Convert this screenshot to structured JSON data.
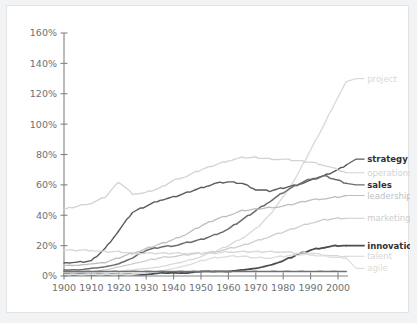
{
  "chart_data": {
    "type": "line",
    "title": "",
    "xlabel": "",
    "ylabel": "",
    "xlim": [
      1900,
      2005
    ],
    "ylim": [
      0,
      160
    ],
    "grid": false,
    "legend_position": "right-inline-labels",
    "x_ticks": [
      "1900",
      "1910",
      "1920",
      "1930",
      "1940",
      "1950",
      "1960",
      "1970",
      "1980",
      "1990",
      "2000"
    ],
    "y_ticks": [
      "0%",
      "20%",
      "40%",
      "60%",
      "80%",
      "100%",
      "120%",
      "140%",
      "160%"
    ],
    "x": [
      1900,
      1905,
      1910,
      1915,
      1920,
      1925,
      1930,
      1935,
      1940,
      1945,
      1950,
      1955,
      1960,
      1965,
      1970,
      1975,
      1980,
      1985,
      1990,
      1995,
      2000,
      2003
    ],
    "series": [
      {
        "name": "project",
        "label": "project",
        "color": "#d8d9da",
        "width": 1.3,
        "bold": false,
        "label_y_pct": 130,
        "values": [
          2,
          2,
          2,
          3,
          3,
          4,
          5,
          6,
          8,
          10,
          13,
          16,
          20,
          25,
          31,
          40,
          52,
          66,
          83,
          100,
          118,
          128
        ]
      },
      {
        "name": "strategy",
        "label": "strategy",
        "color": "#585b5e",
        "width": 1.4,
        "bold": true,
        "label_y_pct": 77,
        "values": [
          9,
          9,
          10,
          18,
          30,
          42,
          46,
          50,
          52,
          55,
          58,
          61,
          62,
          61,
          57,
          56,
          58,
          60,
          63,
          66,
          70,
          73
        ]
      },
      {
        "name": "operations",
        "label": "operations",
        "color": "#d2d3d4",
        "width": 1.3,
        "bold": false,
        "label_y_pct": 68,
        "values": [
          44,
          46,
          48,
          52,
          62,
          54,
          55,
          58,
          63,
          66,
          70,
          73,
          76,
          78,
          78,
          77,
          77,
          76,
          75,
          73,
          70,
          68
        ]
      },
      {
        "name": "sales",
        "label": "sales",
        "color": "#6a6d70",
        "width": 1.5,
        "bold": true,
        "label_y_pct": 60,
        "values": [
          4,
          4,
          5,
          6,
          8,
          12,
          17,
          19,
          20,
          22,
          24,
          27,
          31,
          37,
          43,
          49,
          55,
          60,
          64,
          66,
          63,
          61
        ]
      },
      {
        "name": "leadership",
        "label": "leadership",
        "color": "#bdbec0",
        "width": 1.3,
        "bold": false,
        "label_y_pct": 53,
        "values": [
          7,
          7,
          8,
          9,
          12,
          15,
          18,
          21,
          24,
          28,
          33,
          37,
          40,
          43,
          44,
          45,
          46,
          48,
          50,
          51,
          52,
          53
        ]
      },
      {
        "name": "marketing",
        "label": "marketing",
        "color": "#cccdce",
        "width": 1.3,
        "bold": false,
        "label_y_pct": 38,
        "values": [
          2,
          2,
          3,
          4,
          6,
          8,
          10,
          12,
          13,
          14,
          15,
          16,
          18,
          20,
          23,
          26,
          29,
          32,
          35,
          37,
          38,
          38
        ]
      },
      {
        "name": "innovation",
        "label": "innovation",
        "color": "#4b4e51",
        "width": 1.8,
        "bold": true,
        "label_y_pct": 20,
        "values": [
          1,
          1,
          1,
          1,
          1,
          1,
          1,
          2,
          2,
          2,
          3,
          3,
          3,
          4,
          5,
          7,
          10,
          14,
          17,
          19,
          20,
          20
        ]
      },
      {
        "name": "talent",
        "label": "talent",
        "color": "#d6d7d8",
        "width": 1.3,
        "bold": false,
        "label_y_pct": 13,
        "values": [
          17,
          17,
          17,
          16,
          16,
          15,
          15,
          15,
          15,
          15,
          15,
          15,
          16,
          16,
          16,
          16,
          16,
          15,
          15,
          14,
          13,
          13
        ]
      },
      {
        "name": "agile",
        "label": "agile",
        "color": "#dcdddd",
        "width": 1.3,
        "bold": false,
        "label_y_pct": 5,
        "values": [
          1,
          1,
          1,
          1,
          1,
          1,
          2,
          3,
          5,
          7,
          10,
          12,
          13,
          13,
          12,
          12,
          13,
          14,
          14,
          13,
          12,
          12
        ]
      },
      {
        "name": "baseline-dark",
        "label": "",
        "color": "#6f7275",
        "width": 1.6,
        "bold": false,
        "label_y_pct": null,
        "values": [
          3,
          3,
          3,
          3,
          3,
          3,
          3,
          3,
          3,
          3,
          3,
          3,
          3,
          3,
          3,
          3,
          3,
          3,
          3,
          3,
          3,
          3
        ]
      }
    ]
  },
  "colors": {
    "page_background": "#f2f3f4",
    "card_background": "#ffffff",
    "card_border": "#e2e3e5",
    "axis": "#808386",
    "tick_text": "#6d7073"
  }
}
